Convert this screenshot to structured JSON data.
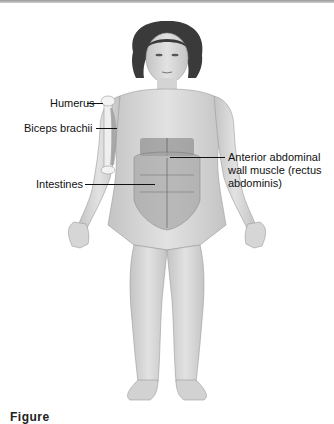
{
  "figure": {
    "labels": [
      {
        "id": "humerus",
        "text": "Humerus"
      },
      {
        "id": "biceps-brachii",
        "text": "Biceps brachii"
      },
      {
        "id": "intestines",
        "text": "Intestines"
      },
      {
        "id": "anterior-abdominal-wall",
        "text": "Anterior abdominal wall muscle (rectus abdominis)"
      }
    ],
    "caption": {
      "text": "Figure",
      "note": "caption clipped at bottom edge; remainder unreadable"
    }
  },
  "colors": {
    "background": "#ffffff",
    "label_text": "#111111",
    "skin_fill": "#d9d9d9",
    "skin_shade": "#bdbdbd",
    "hair": "#3a3a3a",
    "muscle": "#8a8a8a"
  }
}
